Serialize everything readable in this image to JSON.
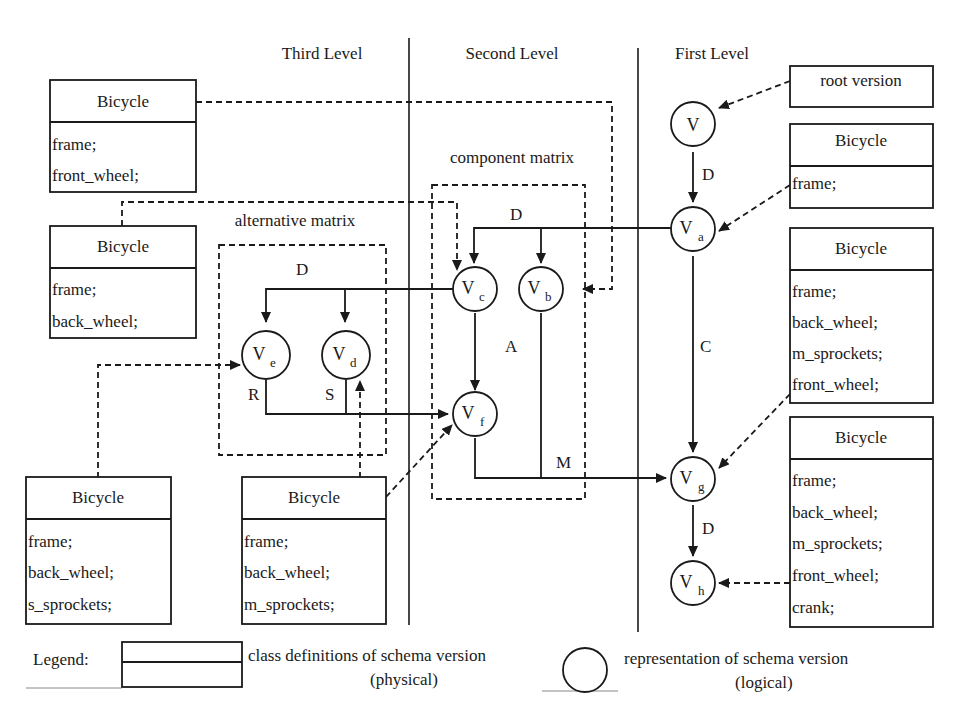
{
  "levels": {
    "third": "Third Level",
    "second": "Second Level",
    "first": "First Level"
  },
  "regions": {
    "component_matrix": "component matrix",
    "alternative_matrix": "alternative matrix"
  },
  "root_label": "root version",
  "nodes": {
    "v": {
      "main": "V",
      "sub": ""
    },
    "va": {
      "main": "V",
      "sub": "a"
    },
    "vb": {
      "main": "V",
      "sub": "b"
    },
    "vc": {
      "main": "V",
      "sub": "c"
    },
    "vd": {
      "main": "V",
      "sub": "d"
    },
    "ve": {
      "main": "V",
      "sub": "e"
    },
    "vf": {
      "main": "V",
      "sub": "f"
    },
    "vg": {
      "main": "V",
      "sub": "g"
    },
    "vh": {
      "main": "V",
      "sub": "h"
    }
  },
  "edges": {
    "v_va": "D",
    "va_vcvb": "D",
    "vc_vevd": "D",
    "vc_vf": "A",
    "va_vg": "C",
    "vb_vg": "M",
    "ve_vf": "R",
    "vd_vf": "S",
    "vg_vh": "D"
  },
  "classes": {
    "left1": {
      "name": "Bicycle",
      "fields": [
        "frame;",
        "front_wheel;"
      ]
    },
    "left2": {
      "name": "Bicycle",
      "fields": [
        "frame;",
        "back_wheel;"
      ]
    },
    "bottom1": {
      "name": "Bicycle",
      "fields": [
        "frame;",
        "back_wheel;",
        "s_sprockets;"
      ]
    },
    "bottom2": {
      "name": "Bicycle",
      "fields": [
        "frame;",
        "back_wheel;",
        "m_sprockets;"
      ]
    },
    "right1": {
      "name": "Bicycle",
      "fields": [
        "frame;"
      ]
    },
    "right2": {
      "name": "Bicycle",
      "fields": [
        "frame;",
        "back_wheel;",
        "m_sprockets;",
        "front_wheel;"
      ]
    },
    "right3": {
      "name": "Bicycle",
      "fields": [
        "frame;",
        "back_wheel;",
        "m_sprockets;",
        "front_wheel;",
        "crank;"
      ]
    }
  },
  "legend": {
    "label": "Legend:",
    "physical_line1": "class definitions of schema version",
    "physical_line2": "(physical)",
    "logical_line1": "representation of schema version",
    "logical_line2": "(logical)"
  }
}
